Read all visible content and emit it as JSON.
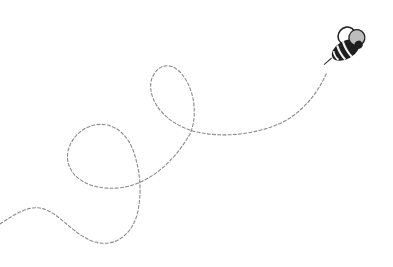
{
  "illustration": {
    "subject": "bee flying with dashed loop trail",
    "trail_color": "#8a8a8a",
    "bee_body_color": "#1e1e1e",
    "bee_stripe_color": "#f2f2f2",
    "bee_wing_fill": "#bdbdbd",
    "background": "#ffffff"
  }
}
